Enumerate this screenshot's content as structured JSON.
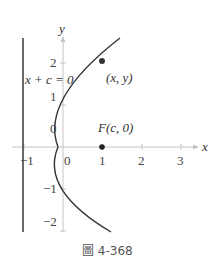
{
  "figure": {
    "caption": "圖 4-368",
    "type": "parabola-diagram",
    "axes": {
      "x_label": "x",
      "y_label": "y",
      "x_ticks": [
        "−1",
        "0",
        "1",
        "2",
        "3"
      ],
      "y_ticks": [
        "2",
        "1",
        "0",
        "−1",
        "−2"
      ]
    },
    "directrix_label": "x + c = 0",
    "point_label": "(x, y)",
    "focus_label": "F(c, 0)",
    "colors": {
      "curve": "#333333",
      "axis": "#bbbbbb",
      "directrix": "#444444",
      "point": "#333333"
    }
  }
}
